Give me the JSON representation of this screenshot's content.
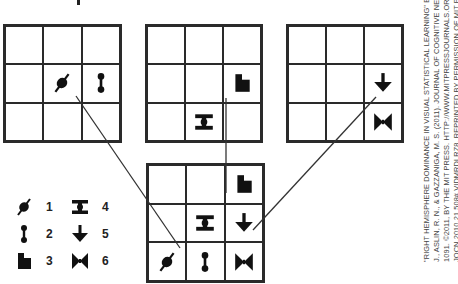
{
  "figure": {
    "shapes_legend": [
      {
        "number": "1",
        "icon": "slashed-blob-icon"
      },
      {
        "number": "2",
        "icon": "dumbbell-icon"
      },
      {
        "number": "3",
        "icon": "flag-block-icon"
      },
      {
        "number": "4",
        "icon": "i-beam-icon"
      },
      {
        "number": "5",
        "icon": "down-arrow-icon"
      },
      {
        "number": "6",
        "icon": "bowtie-icon"
      }
    ],
    "grids": {
      "a": {
        "cells": [
          [
            "",
            "",
            ""
          ],
          [
            "1",
            "2",
            ""
          ],
          [
            "",
            "",
            ""
          ]
        ]
      },
      "b": {
        "cells": [
          [
            "",
            "",
            ""
          ],
          [
            "",
            "",
            "3"
          ],
          [
            "",
            "4",
            ""
          ]
        ]
      },
      "c": {
        "cells": [
          [
            "",
            "",
            ""
          ],
          [
            "",
            "",
            "5"
          ],
          [
            "",
            "",
            "6"
          ]
        ]
      },
      "combined": {
        "cells": [
          [
            "",
            "",
            "3"
          ],
          [
            "",
            "4",
            "5"
          ],
          [
            "1",
            "2",
            "6"
          ]
        ]
      }
    },
    "arrows": [
      {
        "from": "grid-a",
        "to": "combined"
      },
      {
        "from": "grid-b",
        "to": "combined"
      },
      {
        "from": "grid-c",
        "to": "combined"
      }
    ]
  },
  "citation": {
    "line1": "\"RIGHT HEMISPHERE DOMINANCE IN VISUAL STATISTICAL LEARNING\" BY ROSER, M. E., FISER,",
    "line2": "J., ASLIN, R. N., & GAZZANIGA, M. S. (2011). JOURNAL OF COGNITIVE NEUROSCIENCE, 23,",
    "line3": "1091. ©2011, BY THE MIT PRESS. HTTP://WWW.MITPRESSJOURNALS.ORG/DOI/ABS/10.1162/",
    "line4": "JOCN.2010.21 508#.VIDMRDLRZ8. REPRINTED BY PERMISSION OF MIT PRESS JOURNALS."
  }
}
